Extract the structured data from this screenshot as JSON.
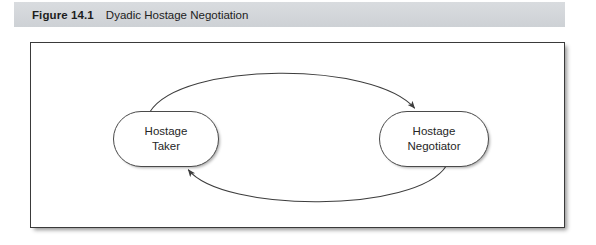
{
  "figure": {
    "number": "Figure 14.1",
    "title": "Dyadic Hostage Negotiation"
  },
  "diagram": {
    "type": "cycle-diagram",
    "nodes": [
      {
        "id": "hostage-taker",
        "line1": "Hostage",
        "line2": "Taker"
      },
      {
        "id": "hostage-negotiator",
        "line1": "Hostage",
        "line2": "Negotiator"
      }
    ],
    "edges": [
      {
        "id": "taker-to-negotiator",
        "from": "hostage-taker",
        "to": "hostage-negotiator",
        "direction": "right",
        "curve": "arc-above",
        "label": ""
      },
      {
        "id": "negotiator-to-taker",
        "from": "hostage-negotiator",
        "to": "hostage-taker",
        "direction": "left",
        "curve": "arc-below",
        "label": ""
      }
    ]
  },
  "colors": {
    "caption_bar": "#d3d6da",
    "frame_border": "#3a3a3a",
    "node_border": "#4a4a4a",
    "arrow": "#3d3d3d",
    "text": "#222222",
    "page_background": "#ffffff"
  }
}
